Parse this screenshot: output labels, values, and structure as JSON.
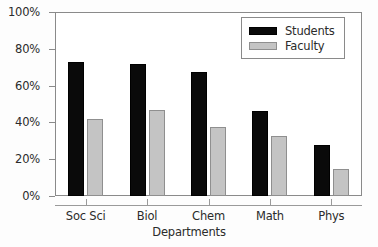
{
  "chart_data": {
    "type": "bar",
    "title": "",
    "xlabel": "Departments",
    "ylabel": "",
    "categories": [
      "Soc Sci",
      "Biol",
      "Chem",
      "Math",
      "Phys"
    ],
    "series": [
      {
        "name": "Students",
        "color": "#0a0a0a",
        "values": [
          73,
          72,
          67.5,
          46,
          27.5
        ]
      },
      {
        "name": "Faculty",
        "color": "#c4c4c4",
        "values": [
          42,
          47,
          37.5,
          32.5,
          14.5
        ]
      }
    ],
    "ylim": [
      0,
      100
    ],
    "yticks": [
      0,
      20,
      40,
      60,
      80,
      100
    ],
    "ytick_labels": [
      "0%",
      "20%",
      "40%",
      "60%",
      "80%",
      "100%"
    ],
    "grid": false,
    "legend_position": "top-right",
    "legend_entries": [
      "Students",
      "Faculty"
    ]
  }
}
